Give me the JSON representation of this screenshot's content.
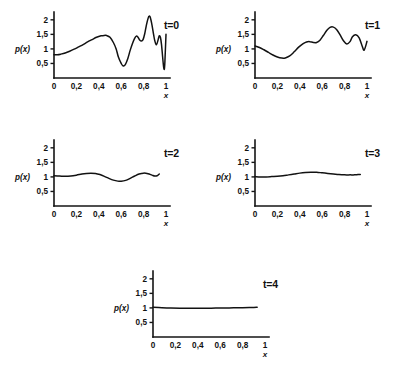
{
  "figure": {
    "background_color": "#ffffff",
    "line_color": "#121212",
    "axis_color": "#151515"
  },
  "axes": {
    "y_label": "p(x)",
    "x_axis_name": "x",
    "y_ticks": [
      "2",
      "1,5",
      "1",
      "0,5"
    ],
    "y_tick_values": [
      2,
      1.5,
      1,
      0.5
    ],
    "x_ticks": [
      "0",
      "0,2",
      "0,4",
      "0,6",
      "0,8",
      "1"
    ],
    "x_tick_values": [
      0,
      0.2,
      0.4,
      0.6,
      0.8,
      1
    ],
    "xlim": [
      0,
      1
    ],
    "ylim": [
      0,
      2.2
    ]
  },
  "chart_data": {
    "type": "line",
    "title": "",
    "xlabel": "x",
    "ylabel": "p(x)",
    "xlim": [
      0,
      1
    ],
    "ylim": [
      0,
      2.2
    ],
    "grid": false,
    "legend": "none",
    "panel_labels": [
      "t=0",
      "t=1",
      "t=2",
      "t=3",
      "t=4"
    ],
    "series": [
      {
        "name": "t=0",
        "label": "t=0",
        "x": [
          0.0,
          0.03,
          0.06,
          0.1,
          0.14,
          0.18,
          0.22,
          0.26,
          0.3,
          0.34,
          0.38,
          0.42,
          0.45,
          0.47,
          0.5,
          0.53,
          0.555,
          0.575,
          0.6,
          0.615,
          0.635,
          0.66,
          0.68,
          0.7,
          0.72,
          0.735,
          0.75,
          0.765,
          0.78,
          0.795,
          0.81,
          0.825,
          0.84,
          0.85,
          0.86,
          0.875,
          0.89,
          0.9,
          0.915,
          0.93,
          0.94,
          0.95,
          0.96,
          0.97,
          0.978,
          0.985,
          0.99,
          1.0
        ],
        "y": [
          0.8,
          0.8,
          0.82,
          0.86,
          0.92,
          0.99,
          1.07,
          1.15,
          1.24,
          1.32,
          1.4,
          1.45,
          1.465,
          1.46,
          1.4,
          1.22,
          1.0,
          0.72,
          0.5,
          0.42,
          0.45,
          0.68,
          0.95,
          1.18,
          1.36,
          1.44,
          1.4,
          1.31,
          1.27,
          1.32,
          1.52,
          1.82,
          2.05,
          2.13,
          2.08,
          1.82,
          1.48,
          1.28,
          1.14,
          1.32,
          1.45,
          1.4,
          1.15,
          0.72,
          0.4,
          0.3,
          0.55,
          1.5
        ],
        "description": "rough multi-peak initial density"
      },
      {
        "name": "t=1",
        "label": "t=1",
        "x": [
          0.0,
          0.04,
          0.08,
          0.12,
          0.16,
          0.2,
          0.24,
          0.27,
          0.31,
          0.35,
          0.39,
          0.43,
          0.46,
          0.49,
          0.52,
          0.55,
          0.58,
          0.61,
          0.64,
          0.67,
          0.7,
          0.73,
          0.76,
          0.79,
          0.82,
          0.85,
          0.87,
          0.9,
          0.93,
          0.955,
          0.975,
          1.0
        ],
        "y": [
          1.1,
          1.05,
          0.97,
          0.88,
          0.79,
          0.72,
          0.685,
          0.69,
          0.76,
          0.9,
          1.06,
          1.18,
          1.24,
          1.25,
          1.22,
          1.22,
          1.3,
          1.46,
          1.63,
          1.74,
          1.75,
          1.66,
          1.48,
          1.28,
          1.17,
          1.26,
          1.42,
          1.49,
          1.38,
          1.12,
          0.96,
          1.26
        ],
        "description": "smoothed, fewer oscillations"
      },
      {
        "name": "t=2",
        "label": "t=2",
        "x": [
          0.0,
          0.05,
          0.1,
          0.15,
          0.2,
          0.25,
          0.29,
          0.33,
          0.37,
          0.41,
          0.45,
          0.49,
          0.53,
          0.57,
          0.6,
          0.64,
          0.68,
          0.72,
          0.76,
          0.8,
          0.84,
          0.875,
          0.9,
          0.925,
          0.94
        ],
        "y": [
          1.04,
          1.03,
          1.02,
          1.03,
          1.06,
          1.1,
          1.12,
          1.13,
          1.12,
          1.08,
          1.02,
          0.95,
          0.89,
          0.855,
          0.85,
          0.88,
          0.95,
          1.03,
          1.1,
          1.13,
          1.11,
          1.06,
          1.03,
          1.05,
          1.1
        ],
        "description": "gentle low-amplitude wave about 1.0"
      },
      {
        "name": "t=3",
        "label": "t=3",
        "x": [
          0.0,
          0.05,
          0.1,
          0.15,
          0.2,
          0.25,
          0.3,
          0.35,
          0.4,
          0.45,
          0.5,
          0.55,
          0.6,
          0.65,
          0.7,
          0.75,
          0.8,
          0.85,
          0.89,
          0.92,
          0.94
        ],
        "y": [
          1.01,
          1.0,
          1.0,
          1.01,
          1.02,
          1.04,
          1.07,
          1.1,
          1.13,
          1.15,
          1.16,
          1.16,
          1.14,
          1.12,
          1.1,
          1.08,
          1.07,
          1.07,
          1.07,
          1.08,
          1.08
        ],
        "description": "nearly flat with a single broad bump"
      },
      {
        "name": "t=4",
        "label": "t=4",
        "x": [
          0.0,
          0.08,
          0.16,
          0.24,
          0.32,
          0.4,
          0.48,
          0.56,
          0.64,
          0.72,
          0.8,
          0.86,
          0.9,
          0.93
        ],
        "y": [
          1.02,
          1.005,
          0.995,
          0.99,
          0.988,
          0.988,
          0.99,
          0.993,
          0.998,
          1.003,
          1.008,
          1.013,
          1.018,
          1.02
        ],
        "description": "flat equilibrium at 1.0"
      }
    ]
  },
  "panels": [
    {
      "id": "panel-t0",
      "label": "t=0",
      "series_index": 0
    },
    {
      "id": "panel-t1",
      "label": "t=1",
      "series_index": 1
    },
    {
      "id": "panel-t2",
      "label": "t=2",
      "series_index": 2
    },
    {
      "id": "panel-t3",
      "label": "t=3",
      "series_index": 3
    },
    {
      "id": "panel-t4",
      "label": "t=4",
      "series_index": 4
    }
  ]
}
